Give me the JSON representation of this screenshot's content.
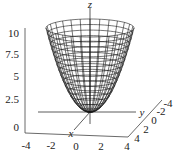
{
  "chart_data": {
    "type": "surface3d",
    "title": "",
    "function": "z = x^2 + y^2",
    "surface_style": "wireframe",
    "xlabel": "x",
    "ylabel": "y",
    "zlabel": "z",
    "x_ticks": [
      "-4",
      "-2",
      "0",
      "2",
      "4"
    ],
    "y_ticks": [
      "4",
      "2",
      "0",
      "-2",
      "-4"
    ],
    "z_ticks": [
      "10",
      "7.5",
      "5",
      "2.5",
      "0"
    ],
    "xlim": [
      -4,
      4
    ],
    "ylim": [
      -4,
      4
    ],
    "zlim": [
      0,
      10
    ],
    "grid": false,
    "line_color": "#222222"
  },
  "labels": {
    "x": "x",
    "y": "y",
    "z": "z",
    "bottom_ticks": [
      "-4",
      "-2",
      "0",
      "2",
      "4"
    ],
    "depth_ticks": [
      "4",
      "2",
      "0",
      "-2",
      "-4"
    ],
    "vertical_ticks": [
      "10",
      "7.5",
      "5",
      "2.5",
      "0"
    ]
  }
}
